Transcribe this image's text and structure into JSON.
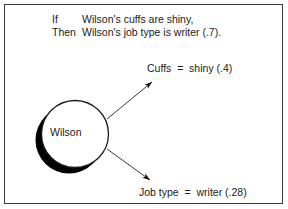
{
  "figure": {
    "title_present": false,
    "background": "#ffffff",
    "border_color": "#3a3a3a",
    "ink_color": "#1a1a1a"
  },
  "rule": {
    "antecedent_keyword": "If",
    "antecedent_text": "Wilson's cuffs are shiny,",
    "consequent_keyword": "Then",
    "consequent_text": "Wilson's job type is writer (.7)."
  },
  "node": {
    "label": "Wilson",
    "shape": "circle-with-drop-shadow",
    "fill": "#ffffff",
    "stroke": "#1a1a1a",
    "shadow_fill": "#000000"
  },
  "edges": [
    {
      "name": "edge-to-cuffs",
      "direction": "up-right",
      "arrowhead": "filled",
      "target_label": "Cuffs  =  shiny (.4)"
    },
    {
      "name": "edge-to-job-type",
      "direction": "down-right",
      "arrowhead": "filled",
      "target_label": "Job type  =  writer (.28)"
    }
  ],
  "labels": {
    "cuffs": "Cuffs  =  shiny (.4)",
    "job_type": "Job type  =  writer (.28)"
  }
}
